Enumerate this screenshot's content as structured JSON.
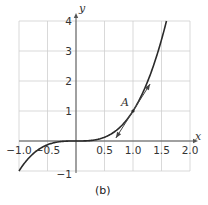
{
  "caption": "(b)",
  "colors": {
    "grid": "#cfcfcf",
    "axis": "#555555",
    "curve": "#2a2a2a",
    "tangent": "#444444",
    "text": "#333333"
  },
  "point_label": "A",
  "chart_data": {
    "type": "line",
    "title": "",
    "caption": "(b)",
    "xlabel": "x",
    "ylabel": "y",
    "xlim": [
      -1.0,
      2.0
    ],
    "ylim": [
      -1,
      4
    ],
    "grid": true,
    "x_ticks": [
      "-1.0",
      "-0.5",
      "0.5",
      "1.0",
      "1.5",
      "2.0"
    ],
    "y_ticks": [
      "-1",
      "1",
      "2",
      "3",
      "4"
    ],
    "series": [
      {
        "name": "y = x^3",
        "x": [
          -1.0,
          -0.75,
          -0.5,
          -0.25,
          0,
          0.25,
          0.5,
          0.75,
          1.0,
          1.25,
          1.5,
          1.587
        ],
        "y": [
          -1.0,
          -0.422,
          -0.125,
          -0.016,
          0,
          0.016,
          0.125,
          0.422,
          1.0,
          1.953,
          3.375,
          4.0
        ]
      },
      {
        "name": "tangent at A",
        "x": [
          0.7,
          1.3
        ],
        "y": [
          0.1,
          1.9
        ]
      }
    ],
    "annotations": [
      {
        "label": "A",
        "x": 1.0,
        "y": 1.0
      }
    ]
  }
}
